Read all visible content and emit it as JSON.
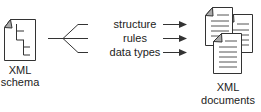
{
  "source": {
    "line1": "XML",
    "line2": "schema",
    "icon": "schema-document-icon"
  },
  "relations": [
    {
      "label": "structure"
    },
    {
      "label": "rules"
    },
    {
      "label": "data types"
    }
  ],
  "target": {
    "line1": "XML",
    "line2": "documents",
    "icon": "document-stack-icon"
  },
  "colors": {
    "stroke": "#333333",
    "fold": "#aaaaaa",
    "text": "#222222"
  }
}
